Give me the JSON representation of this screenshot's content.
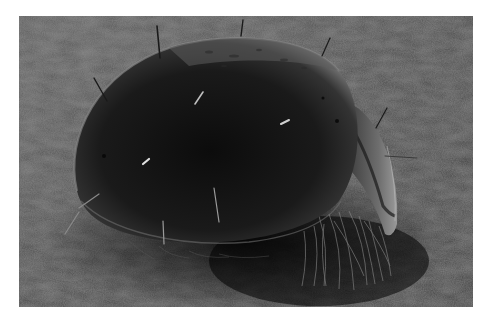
{
  "image": {
    "kind": "scanning electron micrograph",
    "subject": "oribatid mite on textured substrate",
    "alt": "Grayscale SEM image of a dome-shaped mite with sparse setae and a fringe of hairs underneath",
    "colors": {
      "page_background": "#ffffff",
      "substrate": "#4a4a4a",
      "body_dark": "#111111",
      "body_rim": "#6a6a6a",
      "highlight": "#c8c8c8"
    },
    "frame": {
      "x": 19,
      "y": 16,
      "width": 454,
      "height": 291
    }
  }
}
